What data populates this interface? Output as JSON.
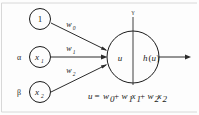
{
  "diagram": {
    "background_color": "#fdfdfd",
    "stroke_color": "#1a1a1a",
    "input_nodes": [
      {
        "label": "1",
        "greek": "",
        "style": "plain"
      },
      {
        "label": "x",
        "sub": "1",
        "greek": "α",
        "style": "italic"
      },
      {
        "label": "x",
        "sub": "2",
        "greek": "β",
        "style": "italic"
      }
    ],
    "weights": [
      {
        "label": "w",
        "sub": "0"
      },
      {
        "label": "w",
        "sub": "1"
      },
      {
        "label": "w",
        "sub": "2"
      }
    ],
    "neuron": {
      "top_label": "γ",
      "left_label": "u",
      "right_label": "h",
      "right_arg_open": "(",
      "right_arg": "u",
      "right_arg_close": ")"
    },
    "equation": {
      "lhs": "u",
      "eq": "=",
      "term0": "w",
      "term0_sub": "0",
      "plus1": "+",
      "term1_w": "w",
      "term1_w_sub": "1",
      "term1_x": "x",
      "term1_x_sub": "1",
      "plus2": "+",
      "term2_w": "w",
      "term2_w_sub": "2",
      "term2_x": "x",
      "term2_x_sub": "2",
      "full_text": "u = w0 + w1x1 + w2x2"
    }
  }
}
